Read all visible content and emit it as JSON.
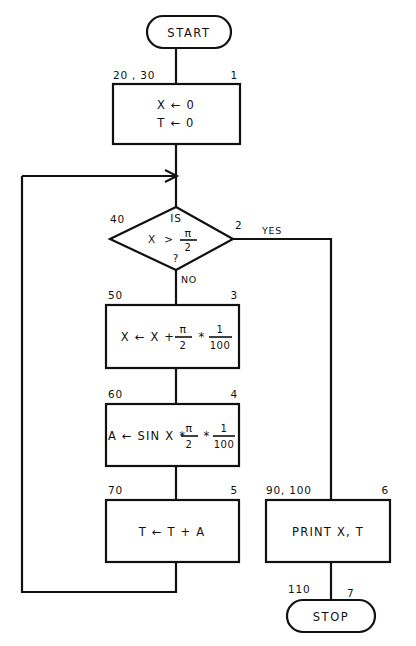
{
  "diagram": {
    "background_color": "#ffffff",
    "stroke_color": "#111111"
  },
  "nodes": {
    "start": {
      "type": "terminal",
      "text": "START",
      "step_label": "",
      "line_label": ""
    },
    "box1": {
      "type": "process",
      "line1": "X  ←  0",
      "line2": "T  ←  0",
      "line_label": "20 , 30",
      "step_label": "1"
    },
    "decision": {
      "type": "decision",
      "line_top": "IS",
      "expr_var": "X",
      "expr_op": ">",
      "expr_num": "π",
      "expr_den": "2",
      "line_bottom": "?",
      "line_label": "40",
      "step_label": "2",
      "branch_yes": "YES",
      "branch_no": "NO"
    },
    "box3": {
      "type": "process",
      "lead": "X  ←  X  +",
      "frac1_num": "π",
      "frac1_den": "2",
      "op": "*",
      "frac2_num": "1",
      "frac2_den": "100",
      "line_label": "50",
      "step_label": "3"
    },
    "box4": {
      "type": "process",
      "lead": "A  ←  SIN X  *",
      "frac1_num": "π",
      "frac1_den": "2",
      "op": "*",
      "frac2_num": "1",
      "frac2_den": "100",
      "line_label": "60",
      "step_label": "4"
    },
    "box5": {
      "type": "process",
      "text": "T  ←  T  +  A",
      "line_label": "70",
      "step_label": "5"
    },
    "box6": {
      "type": "process",
      "text": "PRINT X, T",
      "line_label": "90, 100",
      "step_label": "6"
    },
    "stop": {
      "type": "terminal",
      "text": "STOP",
      "line_label": "110",
      "step_label": "7"
    }
  }
}
